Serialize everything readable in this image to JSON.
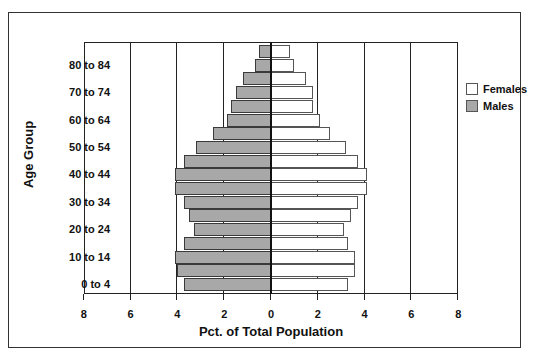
{
  "chart_data": {
    "type": "bar",
    "orientation": "horizontal",
    "subtype": "population-pyramid",
    "title": "",
    "xlabel": "Pct. of Total Population",
    "ylabel": "Age Group",
    "xlim": [
      -8,
      8
    ],
    "x_ticks": [
      8,
      6,
      4,
      2,
      0,
      2,
      4,
      6,
      8
    ],
    "gridlines_at": [
      -6,
      -4,
      -2,
      0,
      2,
      4,
      6
    ],
    "y_tick_labels": [
      "80 to 84",
      "70 to 74",
      "60 to 64",
      "50 to 54",
      "40 to 44",
      "30 to 34",
      "20 to 24",
      "10 to 14",
      "0 to 4"
    ],
    "categories": [
      "85+",
      "80 to 84",
      "75 to 79",
      "70 to 74",
      "65 to 69",
      "60 to 64",
      "55 to 59",
      "50 to 54",
      "45 to 49",
      "40 to 44",
      "35 to 39",
      "30 to 34",
      "25 to 29",
      "20 to 24",
      "15 to 19",
      "10 to 14",
      "5 to 9",
      "0 to 4"
    ],
    "series": [
      {
        "name": "Males",
        "color": "#a8a8a8",
        "side": "left",
        "values": [
          0.5,
          0.7,
          1.2,
          1.5,
          1.7,
          1.9,
          2.5,
          3.2,
          3.7,
          4.1,
          4.1,
          3.7,
          3.5,
          3.3,
          3.7,
          4.1,
          4.0,
          3.7
        ]
      },
      {
        "name": "Females",
        "color": "#ffffff",
        "side": "right",
        "values": [
          0.8,
          1.0,
          1.5,
          1.8,
          1.8,
          2.1,
          2.5,
          3.2,
          3.7,
          4.1,
          4.1,
          3.7,
          3.4,
          3.1,
          3.3,
          3.6,
          3.6,
          3.3
        ]
      }
    ],
    "legend": {
      "position": "right",
      "entries": [
        "Females",
        "Males"
      ]
    },
    "grid": true
  },
  "axis": {
    "x_title": "Pct. of Total Population",
    "y_title": "Age Group",
    "x_tick_labels": [
      "8",
      "6",
      "4",
      "2",
      "0",
      "2",
      "4",
      "6",
      "8"
    ],
    "y_tick_labels": [
      "80 to 84",
      "70 to 74",
      "60 to 64",
      "50 to 54",
      "40 to 44",
      "30 to 34",
      "20 to 24",
      "10 to 14",
      "0 to 4"
    ]
  },
  "legend": {
    "items": [
      {
        "label": "Females",
        "color": "#ffffff"
      },
      {
        "label": "Males",
        "color": "#a8a8a8"
      }
    ]
  }
}
